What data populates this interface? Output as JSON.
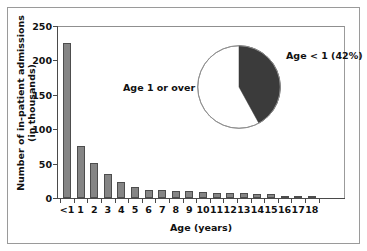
{
  "chart_data": {
    "type": "bar",
    "title": "",
    "xlabel": "Age (years)",
    "ylabel": "Number of in-patient admissions\n(in thousands)",
    "ylim": [
      0,
      250
    ],
    "yticks": [
      0,
      50,
      100,
      150,
      200,
      250
    ],
    "grid": false,
    "categories": [
      "<1",
      "1",
      "2",
      "3",
      "4",
      "5",
      "6",
      "7",
      "8",
      "9",
      "10",
      "11",
      "12",
      "13",
      "14",
      "15",
      "16",
      "17",
      "18"
    ],
    "values": [
      225,
      75,
      51,
      35,
      24,
      16,
      12,
      11,
      10,
      10,
      9,
      8,
      8,
      8,
      6,
      6,
      1,
      1,
      1
    ],
    "bar_color": "#858585",
    "bar_edge_color": "#4d4d4d",
    "inset": {
      "type": "pie",
      "labels": [
        "Age < 1 (42%)",
        "Age 1 or over"
      ],
      "values": [
        42,
        58
      ],
      "colors": [
        "#3b3b3b",
        "#ffffff"
      ],
      "start_angle_deg": 0,
      "direction": "clockwise",
      "label_right": "Age < 1 (42%)",
      "label_left": "Age 1 or over"
    }
  }
}
